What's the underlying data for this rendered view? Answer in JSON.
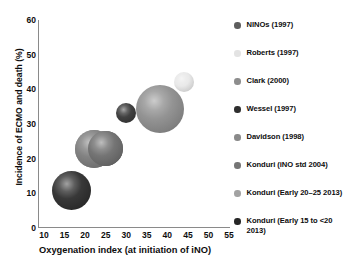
{
  "chart_data": {
    "type": "scatter",
    "title": "",
    "xlabel": "Oxygenation index (at initiation of iNO)",
    "ylabel": "Incidence of ECMO and death (%)",
    "xlim": [
      10,
      55
    ],
    "ylim": [
      0,
      60
    ],
    "xticks": [
      "10",
      "15",
      "20",
      "25",
      "30",
      "35",
      "40",
      "45",
      "50",
      "55"
    ],
    "yticks": [
      "0",
      "10",
      "20",
      "30",
      "40",
      "50",
      "60"
    ],
    "grid": false,
    "legend_position": "right",
    "note": "Bubble chart; bubble area encodes study size",
    "series": [
      {
        "name": "NINOs (1997)",
        "color": "#6b6b6b",
        "x": 25.5,
        "y": 22.9,
        "size": 17.5
      },
      {
        "name": "Roberts (1997)",
        "color": "#e8e8e8",
        "x": 44.0,
        "y": 42.0,
        "size": 10
      },
      {
        "name": "Clark (2000)",
        "color": "#8f8f8f",
        "x": 38.4,
        "y": 34.3,
        "size": 24
      },
      {
        "name": "Wessel (1997)",
        "color": "#3a3a3a",
        "x": 30.4,
        "y": 33.2,
        "size": 10
      },
      {
        "name": "Davidson (1998)",
        "color": "#7d7d7d",
        "x": 22.9,
        "y": 22.8,
        "size": 19
      },
      {
        "name": "Konduri (iNO std 2004)",
        "color": "#6f6f6f",
        "x": 25.5,
        "y": 22.9,
        "size": 17.5
      },
      {
        "name": "Konduri (Early 20–25 2013)",
        "color": "#9a9a9a",
        "x": 22.9,
        "y": 22.8,
        "size": 19
      },
      {
        "name": "Konduri (Early 15 to <20 2013)",
        "color": "#303030",
        "x": 17.7,
        "y": 10.7,
        "size": 19.5
      }
    ]
  },
  "legend": {
    "items": [
      {
        "label": "NINOs (1997)",
        "marker_color": "#5e5e5e"
      },
      {
        "label": "Roberts (1997)",
        "marker_color": "#e3e3e3"
      },
      {
        "label": "Clark (2000)",
        "marker_color": "#8d8d8d"
      },
      {
        "label": "Wessel (1997)",
        "marker_color": "#2e2e2e"
      },
      {
        "label": "Davidson (1998)",
        "marker_color": "#8a8a8a"
      },
      {
        "label": "Konduri (iNO std 2004)",
        "marker_color": "#757575"
      },
      {
        "label": "Konduri (Early 20–25 2013)",
        "marker_color": "#a2a2a2"
      },
      {
        "label": "Konduri (Early 15 to <20 2013)",
        "marker_color": "#262626"
      }
    ]
  }
}
